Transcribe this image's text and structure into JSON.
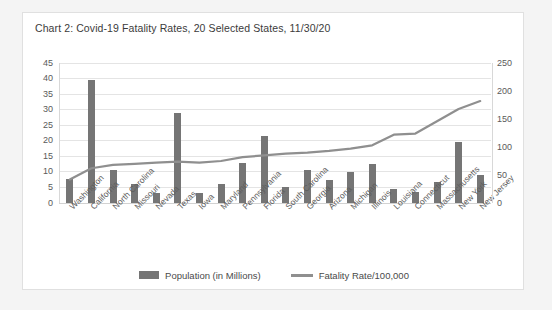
{
  "card": {
    "title": "Chart 2: Covid-19 Fatality Rates, 20 Selected States, 11/30/20"
  },
  "legend": {
    "bar_label": "Population (in Millions)",
    "line_label": "Fatality Rate/100,000"
  },
  "colors": {
    "bar": "#757575",
    "line": "#8f8f8f",
    "grid": "#e4e4e4",
    "card_bg": "#ffffff",
    "page_bg": "#f4f4f4",
    "text": "#5a5a5a"
  },
  "chart_data": {
    "type": "bar",
    "title": "Chart 2: Covid-19 Fatality Rates, 20 Selected States, 11/30/20",
    "xlabel": "",
    "ylabel": "",
    "grid": true,
    "legend_position": "bottom",
    "categories": [
      "Washington",
      "California",
      "North Carolina",
      "Missouri",
      "Nevada",
      "Texas",
      "Iowa",
      "Maryland",
      "Pennsylvania",
      "Florida",
      "South Carolina",
      "Georgia",
      "Arizona",
      "Michigan",
      "Illinois",
      "Louisiana",
      "Connecticut",
      "Massachusetts",
      "New York",
      "New Jersey"
    ],
    "series": [
      {
        "name": "Population (in Millions)",
        "type": "bar",
        "axis": "left",
        "values": [
          7.6,
          39.5,
          10.5,
          6.1,
          3.1,
          29.0,
          3.2,
          6.0,
          12.8,
          21.5,
          5.1,
          10.6,
          7.3,
          10.0,
          12.7,
          4.6,
          3.6,
          6.9,
          19.5,
          8.9
        ]
      },
      {
        "name": "Fatality Rate/100,000",
        "type": "line",
        "axis": "right",
        "values": [
          42,
          62,
          68,
          70,
          72,
          74,
          72,
          75,
          82,
          85,
          88,
          90,
          93,
          97,
          103,
          122,
          124,
          146,
          168,
          182
        ]
      }
    ],
    "yaxis_left": {
      "min": 0,
      "max": 45,
      "step": 5,
      "ticks": [
        0,
        5,
        10,
        15,
        20,
        25,
        30,
        35,
        40,
        45
      ]
    },
    "yaxis_right": {
      "min": 0,
      "max": 250,
      "step": 50,
      "ticks": [
        0,
        50,
        100,
        150,
        200,
        250
      ]
    }
  }
}
